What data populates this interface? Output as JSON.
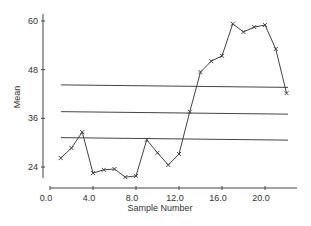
{
  "chart_data": {
    "type": "line",
    "title": "",
    "xlabel": "Sample Number",
    "ylabel": "Mean",
    "xlim": [
      0,
      24
    ],
    "ylim": [
      24,
      60
    ],
    "x_ticks": [
      "0.0",
      "4.0",
      "8.0",
      "12.0",
      "16.0",
      "20.0"
    ],
    "y_ticks": [
      "24",
      "36",
      "48",
      "60"
    ],
    "grid": false,
    "legend": null,
    "x": [
      1,
      2,
      3,
      4,
      5,
      6,
      7,
      8,
      9,
      10,
      11,
      12,
      13,
      14,
      15,
      16,
      17,
      18,
      19,
      20,
      21,
      22
    ],
    "series": [
      {
        "name": "Sample Mean",
        "marker": "x",
        "values": [
          26.2,
          28.7,
          32.6,
          22.5,
          23.3,
          23.5,
          21.5,
          21.8,
          30.7,
          27.5,
          24.5,
          27.2,
          37.6,
          47.4,
          50.1,
          51.4,
          59.3,
          57.3,
          58.5,
          59.0,
          53.1,
          42.2
        ]
      }
    ],
    "reference_lines": [
      {
        "name": "Upper Control Limit",
        "value": 44.0
      },
      {
        "name": "Center Line",
        "value": 37.4
      },
      {
        "name": "Lower Control Limit",
        "value": 31.0
      }
    ]
  }
}
